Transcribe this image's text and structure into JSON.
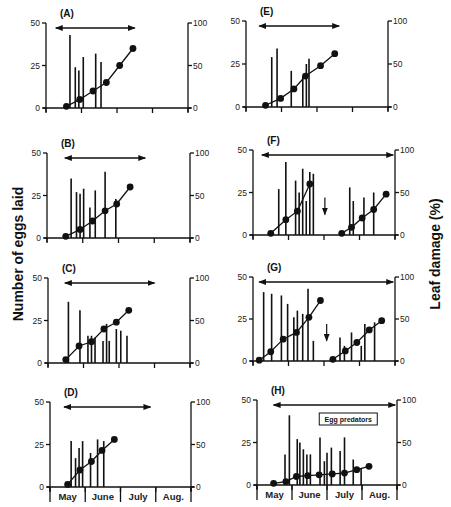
{
  "chart_data": {
    "type": "bar+line",
    "shared": {
      "left_axis_label": "Number of eggs laid",
      "right_axis_label": "Leaf damage (%)",
      "left_ticks": [
        0,
        25,
        50
      ],
      "right_ticks": [
        0,
        50,
        100
      ],
      "months": [
        "May",
        "June",
        "July",
        "Aug."
      ],
      "xrange_weeks": [
        0,
        16
      ],
      "bar_series": "eggs laid (vertical bars, left axis)",
      "line_series": "cumulative leaf damage % (circles, right axis)"
    },
    "panels": [
      {
        "label": "(A)",
        "geom": {
          "x0": 46,
          "x1": 188,
          "ytop": 23,
          "ybot": 108
        },
        "arrow": [
          1.1,
          10.0
        ],
        "eggs": [
          [
            2.7,
            43
          ],
          [
            3.3,
            24
          ],
          [
            3.7,
            22
          ],
          [
            4.2,
            30
          ],
          [
            5.6,
            32
          ],
          [
            6.2,
            27
          ]
        ],
        "damage": [
          [
            2.3,
            2
          ],
          [
            3.8,
            10
          ],
          [
            5.3,
            20
          ],
          [
            6.8,
            30
          ],
          [
            8.3,
            50
          ],
          [
            9.8,
            70
          ]
        ]
      },
      {
        "label": "(E)",
        "geom": {
          "x0": 246,
          "x1": 388,
          "ytop": 21,
          "ybot": 107
        },
        "arrow": [
          1.5,
          10.5
        ],
        "eggs": [
          [
            2.9,
            29
          ],
          [
            3.5,
            34
          ],
          [
            5.1,
            21
          ],
          [
            6.4,
            18
          ],
          [
            6.8,
            25
          ],
          [
            7.1,
            28
          ]
        ],
        "damage": [
          [
            2.2,
            2
          ],
          [
            3.9,
            10
          ],
          [
            5.4,
            21
          ],
          [
            6.7,
            36
          ],
          [
            8.4,
            48
          ],
          [
            10.0,
            62
          ]
        ]
      },
      {
        "label": "(B)",
        "geom": {
          "x0": 47,
          "x1": 190,
          "ytop": 153,
          "ybot": 238
        },
        "arrow": [
          2.0,
          11.0
        ],
        "eggs": [
          [
            2.7,
            35
          ],
          [
            3.3,
            27
          ],
          [
            3.7,
            26
          ],
          [
            4.1,
            29
          ],
          [
            4.8,
            18
          ],
          [
            5.4,
            28
          ],
          [
            6.5,
            39
          ],
          [
            7.7,
            23
          ]
        ],
        "damage": [
          [
            2.1,
            2
          ],
          [
            3.7,
            10
          ],
          [
            5.1,
            20
          ],
          [
            6.5,
            32
          ],
          [
            7.8,
            40
          ],
          [
            9.3,
            60
          ]
        ]
      },
      {
        "label": "(F)",
        "geom": {
          "x0": 253,
          "x1": 395,
          "ytop": 150,
          "ybot": 235
        },
        "arrow": [
          1.0,
          15.8
        ],
        "eggs": [
          [
            2.9,
            27
          ],
          [
            3.7,
            43
          ],
          [
            4.8,
            32
          ],
          [
            5.2,
            25
          ],
          [
            5.6,
            39
          ],
          [
            6.0,
            20
          ],
          [
            6.4,
            37
          ],
          [
            6.8,
            36
          ],
          [
            10.9,
            28
          ],
          [
            11.3,
            20
          ],
          [
            12.5,
            22
          ],
          [
            13.6,
            25
          ]
        ],
        "damage": [
          [
            2.0,
            2
          ],
          [
            3.7,
            18
          ],
          [
            5.0,
            28
          ],
          [
            6.4,
            60
          ],
          [
            10.0,
            2
          ],
          [
            11.1,
            9
          ],
          [
            12.3,
            20
          ],
          [
            13.6,
            30
          ],
          [
            15.0,
            48
          ]
        ],
        "break_arrow_x": 8.1
      },
      {
        "label": "(C)",
        "geom": {
          "x0": 48,
          "x1": 190,
          "ytop": 278,
          "ybot": 363
        },
        "arrow": [
          1.9,
          12.0
        ],
        "eggs": [
          [
            2.3,
            36
          ],
          [
            3.6,
            31
          ],
          [
            4.5,
            16
          ],
          [
            4.9,
            16
          ],
          [
            5.3,
            15
          ],
          [
            6.2,
            13
          ],
          [
            6.6,
            23
          ],
          [
            6.9,
            13
          ],
          [
            7.7,
            20
          ],
          [
            8.2,
            19
          ],
          [
            8.9,
            16
          ]
        ],
        "damage": [
          [
            2.0,
            4
          ],
          [
            3.5,
            20
          ],
          [
            4.9,
            25
          ],
          [
            6.3,
            40
          ],
          [
            7.7,
            48
          ],
          [
            9.1,
            62
          ]
        ]
      },
      {
        "label": "(G)",
        "geom": {
          "x0": 253,
          "x1": 395,
          "ytop": 277,
          "ybot": 361
        },
        "arrow": [
          0.7,
          15.8
        ],
        "eggs": [
          [
            1.2,
            41
          ],
          [
            2.1,
            40
          ],
          [
            3.2,
            39
          ],
          [
            3.9,
            34
          ],
          [
            4.6,
            26
          ],
          [
            5.0,
            30
          ],
          [
            5.6,
            28
          ],
          [
            6.2,
            43
          ],
          [
            6.8,
            12
          ],
          [
            9.8,
            14
          ],
          [
            10.3,
            9
          ],
          [
            11.1,
            17
          ],
          [
            12.2,
            9
          ],
          [
            12.6,
            22
          ],
          [
            13.7,
            23
          ]
        ],
        "damage": [
          [
            0.7,
            1
          ],
          [
            2.0,
            11
          ],
          [
            3.4,
            26
          ],
          [
            4.9,
            34
          ],
          [
            6.3,
            52
          ],
          [
            7.6,
            72
          ],
          [
            9.0,
            2
          ],
          [
            10.4,
            12
          ],
          [
            11.7,
            22
          ],
          [
            13.1,
            37
          ],
          [
            14.5,
            48
          ]
        ],
        "break_arrow_x": 8.3
      },
      {
        "label": "(D)",
        "geom": {
          "x0": 50,
          "x1": 191,
          "ytop": 402,
          "ybot": 487
        },
        "arrow": [
          1.6,
          11.4
        ],
        "eggs": [
          [
            2.4,
            27
          ],
          [
            2.9,
            17
          ],
          [
            3.3,
            23
          ],
          [
            3.7,
            27
          ],
          [
            4.6,
            20
          ],
          [
            5.4,
            28
          ],
          [
            6.1,
            27
          ]
        ],
        "damage": [
          [
            2.0,
            3
          ],
          [
            3.4,
            20
          ],
          [
            4.7,
            30
          ],
          [
            5.9,
            43
          ],
          [
            7.3,
            56
          ]
        ]
      },
      {
        "label": "(H)",
        "geom": {
          "x0": 257,
          "x1": 397,
          "ytop": 400,
          "ybot": 485
        },
        "arrow": [
          1.9,
          15.8
        ],
        "eggs": [
          [
            3.2,
            18
          ],
          [
            3.7,
            41
          ],
          [
            4.6,
            27
          ],
          [
            4.9,
            25
          ],
          [
            5.3,
            21
          ],
          [
            5.7,
            18
          ],
          [
            6.1,
            18
          ],
          [
            7.2,
            28
          ],
          [
            7.7,
            14
          ],
          [
            8.0,
            19
          ],
          [
            8.5,
            22
          ],
          [
            9.5,
            20
          ],
          [
            10.0,
            28
          ],
          [
            11.0,
            15
          ],
          [
            11.9,
            10
          ]
        ],
        "damage": [
          [
            1.9,
            2
          ],
          [
            3.3,
            4
          ],
          [
            4.5,
            10
          ],
          [
            5.8,
            11
          ],
          [
            7.1,
            12
          ],
          [
            8.6,
            13
          ],
          [
            10.0,
            14
          ],
          [
            11.4,
            18
          ],
          [
            12.8,
            22
          ]
        ],
        "annotation": "Egg predators"
      }
    ]
  }
}
